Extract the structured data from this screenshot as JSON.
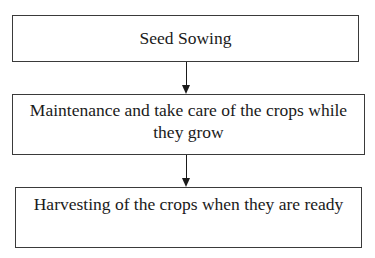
{
  "flowchart": {
    "steps": [
      {
        "label": "Seed Sowing"
      },
      {
        "label": "Maintenance and take care of the crops while they grow"
      },
      {
        "label": "Harvesting of the crops when they are ready"
      }
    ],
    "connectors": [
      {
        "from": 0,
        "to": 1,
        "type": "arrow-down"
      },
      {
        "from": 1,
        "to": 2,
        "type": "arrow-down"
      }
    ],
    "colors": {
      "border": "#3a3a3a",
      "text": "#1a1a1a",
      "background": "#ffffff"
    }
  }
}
